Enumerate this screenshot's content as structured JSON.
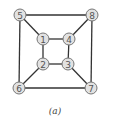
{
  "diagram": {
    "type": "graph",
    "caption": "(a)",
    "colors": {
      "edge": "#333333",
      "node_fill": "#e2e2e2",
      "node_stroke": "#777777",
      "label": "#555555"
    },
    "node_radius": 6,
    "nodes": [
      {
        "id": "1",
        "label": "1",
        "x": 43,
        "y": 39
      },
      {
        "id": "2",
        "label": "2",
        "x": 43,
        "y": 64
      },
      {
        "id": "3",
        "label": "3",
        "x": 68,
        "y": 64
      },
      {
        "id": "4",
        "label": "4",
        "x": 69,
        "y": 39
      },
      {
        "id": "5",
        "label": "5",
        "x": 20,
        "y": 15
      },
      {
        "id": "6",
        "label": "6",
        "x": 19,
        "y": 88
      },
      {
        "id": "7",
        "label": "7",
        "x": 91,
        "y": 88
      },
      {
        "id": "8",
        "label": "8",
        "x": 92,
        "y": 15
      }
    ],
    "edges": [
      [
        "5",
        "8"
      ],
      [
        "5",
        "6"
      ],
      [
        "8",
        "7"
      ],
      [
        "6",
        "7"
      ],
      [
        "1",
        "4"
      ],
      [
        "1",
        "2"
      ],
      [
        "4",
        "3"
      ],
      [
        "2",
        "3"
      ],
      [
        "5",
        "1"
      ],
      [
        "8",
        "4"
      ],
      [
        "6",
        "2"
      ],
      [
        "7",
        "3"
      ]
    ]
  }
}
